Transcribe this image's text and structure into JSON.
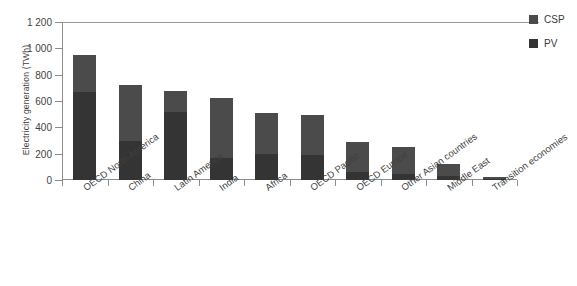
{
  "chart_data": {
    "type": "bar",
    "stacked": true,
    "title": "",
    "xlabel": "",
    "ylabel": "Electricity generation (TWh)",
    "ylim": [
      0,
      1200
    ],
    "ytick_labels": [
      "1 200",
      "1 000",
      "800",
      "600",
      "400",
      "200",
      "0"
    ],
    "ytick_values": [
      1200,
      1000,
      800,
      600,
      400,
      200,
      0
    ],
    "grid": false,
    "legend_position": "right",
    "categories": [
      "OECD North America",
      "China",
      "Latin America",
      "India",
      "Africa",
      "OECD Pacific",
      "OECD Europe",
      "Other Asian countries",
      "Middle East",
      "Transition economies"
    ],
    "series": [
      {
        "name": "PV",
        "color": "#343434",
        "values": [
          670,
          300,
          520,
          165,
          200,
          190,
          60,
          45,
          30,
          8
        ]
      },
      {
        "name": "CSP",
        "color": "#4b4b4b",
        "values": [
          280,
          420,
          155,
          460,
          310,
          300,
          225,
          205,
          90,
          12
        ]
      }
    ],
    "totals": [
      950,
      720,
      675,
      625,
      510,
      490,
      285,
      250,
      120,
      20
    ]
  },
  "legend": {
    "items": [
      {
        "label": "CSP",
        "color": "#4b4b4b"
      },
      {
        "label": "PV",
        "color": "#343434"
      }
    ]
  }
}
